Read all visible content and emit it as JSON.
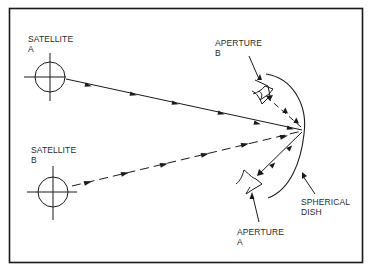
{
  "diagram": {
    "type": "technical-line-drawing",
    "colors": {
      "ink": "#1a1a1a",
      "background": "#ffffff"
    },
    "labels": {
      "satellite_a": {
        "line1": "SATELLITE",
        "line2": "A"
      },
      "satellite_b": {
        "line1": "SATELLITE",
        "line2": "B"
      },
      "aperture_b": {
        "line1": "APERTURE",
        "line2": "B"
      },
      "aperture_a": {
        "line1": "APERTURE",
        "line2": "A"
      },
      "spherical_dish": {
        "line1": "SPHERICAL",
        "line2": "DISH"
      }
    },
    "nodes": [
      {
        "id": "satellite-a",
        "label": "SATELLITE A",
        "symbol": "circle-crosshair"
      },
      {
        "id": "satellite-b",
        "label": "SATELLITE B",
        "symbol": "circle-crosshair"
      },
      {
        "id": "spherical-dish",
        "label": "SPHERICAL DISH",
        "symbol": "arc"
      },
      {
        "id": "aperture-a",
        "label": "APERTURE A",
        "symbol": "feed-horn"
      },
      {
        "id": "aperture-b",
        "label": "APERTURE B",
        "symbol": "feed-horn"
      }
    ],
    "edges": [
      {
        "from": "satellite-a",
        "to": "spherical-dish",
        "style": "solid",
        "arrows": "toward-dish"
      },
      {
        "from": "satellite-b",
        "to": "spherical-dish",
        "style": "dashed",
        "arrows": "toward-dish"
      },
      {
        "from": "spherical-dish",
        "to": "aperture-a",
        "style": "solid",
        "arrows": "bidirectional"
      },
      {
        "from": "spherical-dish",
        "to": "aperture-b",
        "style": "dashed",
        "arrows": "bidirectional"
      }
    ]
  }
}
